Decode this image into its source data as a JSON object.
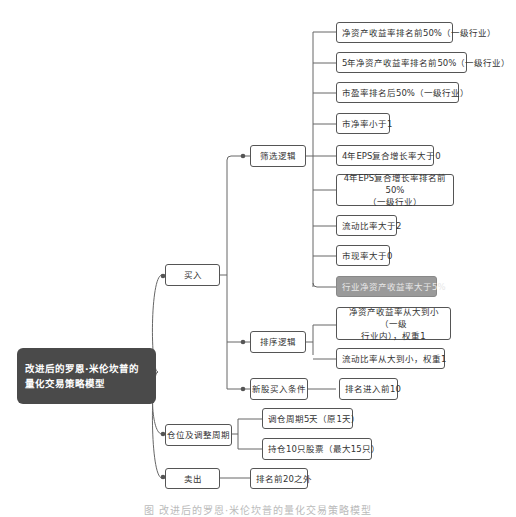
{
  "root": {
    "label": "改进后的罗恩·米伦坎普的量化交易策略模型",
    "line1": "改进后的罗恩·米伦坎普的",
    "line2": "量化交易策略模型"
  },
  "branches": {
    "buy": {
      "label": "买入",
      "screening": {
        "label": "筛选逻辑",
        "items": [
          "净资产收益率排名前50%（一级行业）",
          "5年净资产收益率排名前50%（一级行业）",
          "市盈率排名后50%（一级行业）",
          "市净率小于1",
          "4年EPS复合增长率大于0",
          "4年EPS复合增长率排名前50%（一级行业）",
          "流动比率大于2",
          "市现率大于0",
          "行业净资产收益率大于5%"
        ],
        "item6_line1": "4年EPS复合增长率排名前50%",
        "item6_line2": "（一级行业）"
      },
      "ranking": {
        "label": "排序逻辑",
        "items": [
          "净资产收益率从大到小（一级行业内），权重1",
          "流动比率从大到小，权重1"
        ],
        "item1_line1": "净资产收益率从大到小（一级",
        "item1_line2": "行业内），权重1"
      },
      "new_stock": {
        "label": "新股买入条件",
        "items": [
          "排名进入前10"
        ]
      }
    },
    "position": {
      "label": "仓位及调整周期",
      "items": [
        "调仓周期5天（原1天）",
        "持仓10只股票（最大15只）"
      ]
    },
    "sell": {
      "label": "卖出",
      "items": [
        "排名前20之外"
      ]
    }
  },
  "caption": "图 改进后的罗恩·米伦坎普的量化交易策略模型",
  "colors": {
    "root_bg": "#4a4a4a",
    "highlight_bg": "#9a9a9a",
    "border": "#555555",
    "wire": "#666666"
  }
}
